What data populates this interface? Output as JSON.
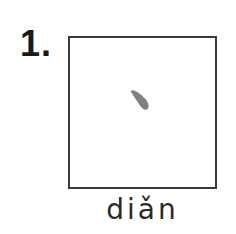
{
  "exercise": {
    "number": "1.",
    "stroke_name": "dot-stroke",
    "pinyin": "diǎn",
    "colors": {
      "border": "#3a3a3a",
      "stroke": "#808080",
      "text": "#2a2a2a"
    }
  }
}
